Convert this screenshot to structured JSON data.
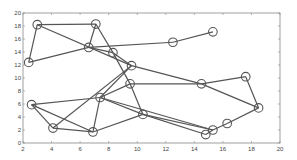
{
  "chart_data": {
    "type": "scatter",
    "title": "",
    "xlabel": "",
    "ylabel": "",
    "xlim": [
      2,
      20
    ],
    "ylim": [
      0,
      20
    ],
    "xticks": [
      2,
      4,
      6,
      8,
      10,
      12,
      14,
      16,
      18,
      20
    ],
    "yticks": [
      0,
      2,
      4,
      6,
      8,
      10,
      12,
      14,
      16,
      18,
      20
    ],
    "grid": false,
    "legend": null,
    "nodes": [
      {
        "id": "A",
        "x": 2.4,
        "y": 12.4
      },
      {
        "id": "B",
        "x": 3.0,
        "y": 18.2
      },
      {
        "id": "C",
        "x": 7.1,
        "y": 18.3
      },
      {
        "id": "D",
        "x": 6.6,
        "y": 14.7
      },
      {
        "id": "E",
        "x": 8.3,
        "y": 13.9
      },
      {
        "id": "F",
        "x": 9.6,
        "y": 11.9
      },
      {
        "id": "G",
        "x": 12.5,
        "y": 15.5
      },
      {
        "id": "H",
        "x": 15.3,
        "y": 17.1
      },
      {
        "id": "I",
        "x": 9.5,
        "y": 9.1
      },
      {
        "id": "J",
        "x": 14.5,
        "y": 9.1
      },
      {
        "id": "K",
        "x": 17.6,
        "y": 10.2
      },
      {
        "id": "L",
        "x": 18.5,
        "y": 5.4
      },
      {
        "id": "M",
        "x": 16.3,
        "y": 3.0
      },
      {
        "id": "N",
        "x": 15.3,
        "y": 2.0
      },
      {
        "id": "O",
        "x": 14.8,
        "y": 1.3
      },
      {
        "id": "P",
        "x": 10.4,
        "y": 4.4
      },
      {
        "id": "Q",
        "x": 7.4,
        "y": 7.0
      },
      {
        "id": "R",
        "x": 2.6,
        "y": 5.9
      },
      {
        "id": "S",
        "x": 4.1,
        "y": 2.3
      },
      {
        "id": "T",
        "x": 6.9,
        "y": 1.7
      }
    ],
    "edges": [
      [
        "A",
        "B"
      ],
      [
        "B",
        "C"
      ],
      [
        "A",
        "D"
      ],
      [
        "B",
        "F"
      ],
      [
        "C",
        "D"
      ],
      [
        "C",
        "E"
      ],
      [
        "D",
        "G"
      ],
      [
        "G",
        "H"
      ],
      [
        "D",
        "E"
      ],
      [
        "E",
        "F"
      ],
      [
        "E",
        "I"
      ],
      [
        "F",
        "Q"
      ],
      [
        "F",
        "S"
      ],
      [
        "I",
        "Q"
      ],
      [
        "I",
        "J"
      ],
      [
        "F",
        "J"
      ],
      [
        "J",
        "K"
      ],
      [
        "J",
        "L"
      ],
      [
        "K",
        "L"
      ],
      [
        "L",
        "M"
      ],
      [
        "M",
        "N"
      ],
      [
        "N",
        "O"
      ],
      [
        "I",
        "P"
      ],
      [
        "P",
        "O"
      ],
      [
        "Q",
        "P"
      ],
      [
        "Q",
        "R"
      ],
      [
        "Q",
        "T"
      ],
      [
        "R",
        "S"
      ],
      [
        "R",
        "T"
      ],
      [
        "S",
        "T"
      ],
      [
        "T",
        "P"
      ],
      [
        "P",
        "N"
      ],
      [
        "Q",
        "N"
      ]
    ]
  },
  "axes": {
    "x_tick_labels": [
      "2",
      "4",
      "6",
      "8",
      "10",
      "12",
      "14",
      "16",
      "18",
      "20"
    ],
    "y_tick_labels": [
      "0",
      "2",
      "4",
      "6",
      "8",
      "10",
      "12",
      "14",
      "16",
      "18",
      "20"
    ]
  },
  "colors": {
    "line": "#555555",
    "marker": "#555555",
    "axis": "#888888"
  }
}
